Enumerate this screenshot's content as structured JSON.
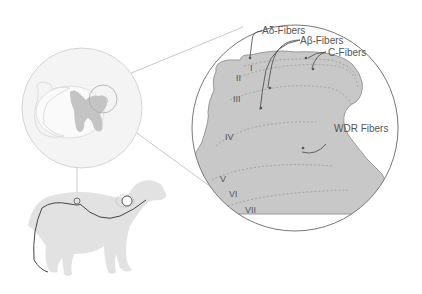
{
  "diagram": {
    "fiber_labels": {
      "a_delta": "Aδ-Fibers",
      "a_beta": "Aβ-Fibers",
      "c": "C-Fibers",
      "wdr": "WDR Fibers"
    },
    "laminae": [
      "I",
      "II",
      "III",
      "IV",
      "V",
      "VI",
      "VII"
    ],
    "colors": {
      "tissue": "#c8c8c8",
      "outline": "#777777",
      "light_fill": "#e6e6e6",
      "text": "#555555"
    }
  }
}
